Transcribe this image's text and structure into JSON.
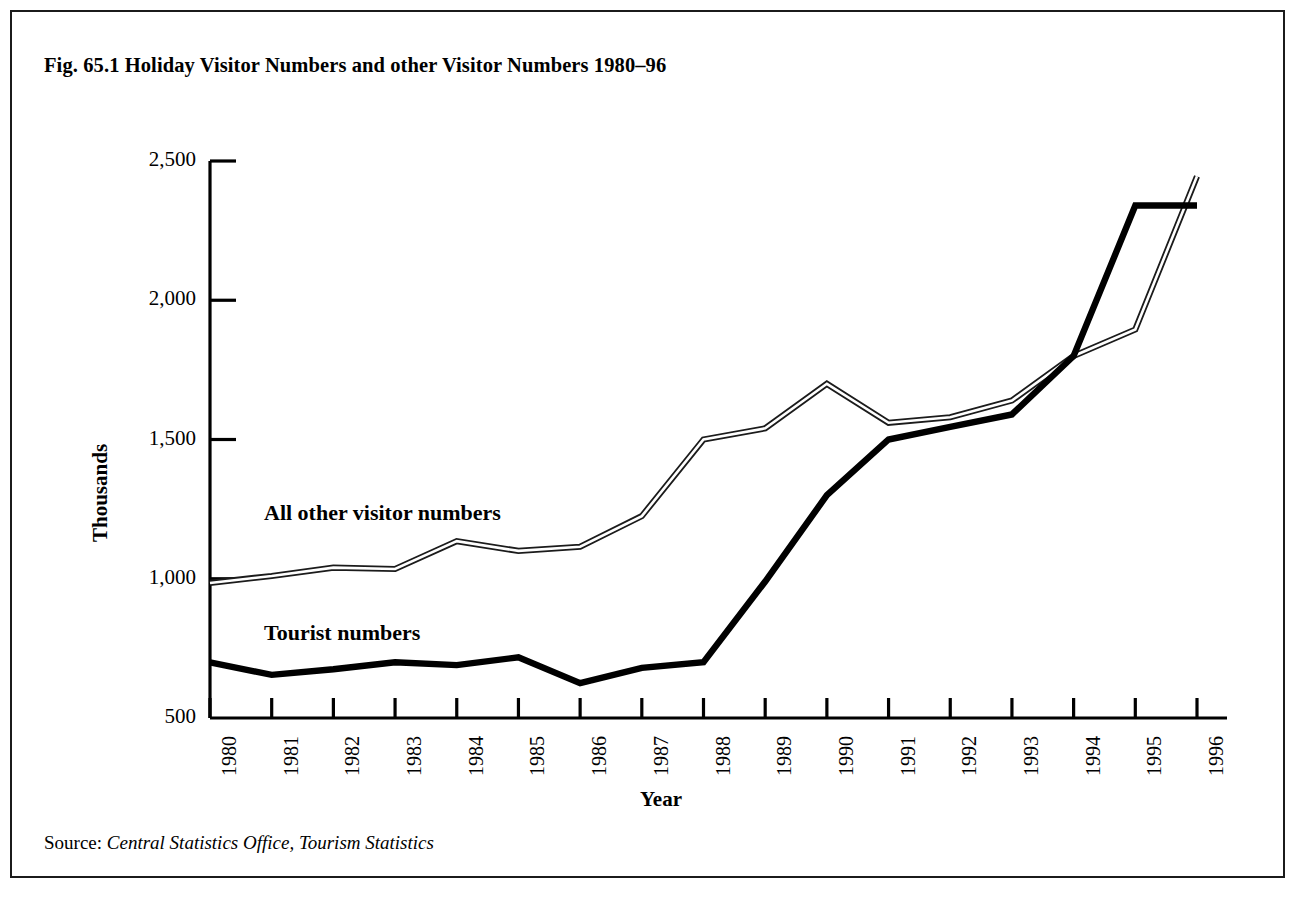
{
  "figure": {
    "title": "Fig. 65.1 Holiday Visitor Numbers and other Visitor Numbers 1980–96",
    "source_label": "Source: ",
    "source_reference": "Central Statistics Office, Tourism Statistics"
  },
  "labels": {
    "series_other": "All other visitor numbers",
    "series_tourist": "Tourist numbers"
  },
  "chart_data": {
    "type": "line",
    "title": "Fig. 65.1 Holiday Visitor Numbers and other Visitor Numbers 1980–96",
    "xlabel": "Year",
    "ylabel": "Thousands",
    "x": [
      1980,
      1981,
      1982,
      1983,
      1984,
      1985,
      1986,
      1987,
      1988,
      1989,
      1990,
      1991,
      1992,
      1993,
      1994,
      1995,
      1996
    ],
    "categories": [
      "1980",
      "1981",
      "1982",
      "1983",
      "1984",
      "1985",
      "1986",
      "1987",
      "1988",
      "1989",
      "1990",
      "1991",
      "1992",
      "1993",
      "1994",
      "1995",
      "1996"
    ],
    "xlim": [
      1980,
      1996
    ],
    "ylim": [
      500,
      2500
    ],
    "yticks": [
      500,
      1000,
      1500,
      2000,
      2500
    ],
    "ytick_labels": [
      "500",
      "1,000",
      "1,500",
      "2,000",
      "2,500"
    ],
    "grid": false,
    "legend": "inline-annotations",
    "series": [
      {
        "name": "All other visitor numbers",
        "style": "outlined-thin",
        "color": "#1b1b1b",
        "values": [
          985,
          1010,
          1040,
          1035,
          1135,
          1100,
          1115,
          1225,
          1500,
          1540,
          1700,
          1560,
          1580,
          1640,
          1800,
          1895,
          2445
        ]
      },
      {
        "name": "Tourist numbers",
        "style": "solid-thick",
        "color": "#000000",
        "values": [
          700,
          655,
          675,
          700,
          690,
          718,
          625,
          680,
          700,
          990,
          1300,
          1500,
          1545,
          1590,
          1800,
          2340,
          2340
        ]
      }
    ]
  },
  "colors": {
    "frame": "#1b1b1b",
    "axis": "#000000",
    "tourist_line": "#000000",
    "other_line": "#1b1b1b"
  }
}
